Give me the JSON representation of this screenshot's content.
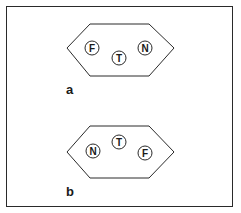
{
  "figure": {
    "panels": [
      {
        "label": "a",
        "pins": [
          {
            "letter": "F",
            "cx": 92,
            "cy": 48
          },
          {
            "letter": "T",
            "cx": 119,
            "cy": 58
          },
          {
            "letter": "N",
            "cx": 145,
            "cy": 48
          }
        ]
      },
      {
        "label": "b",
        "pins": [
          {
            "letter": "N",
            "cx": 93,
            "cy": 151
          },
          {
            "letter": "T",
            "cx": 119,
            "cy": 142
          },
          {
            "letter": "F",
            "cx": 145,
            "cy": 153
          }
        ]
      }
    ],
    "colors": {
      "stroke": "#2a2a2a",
      "background": "#ffffff"
    }
  }
}
